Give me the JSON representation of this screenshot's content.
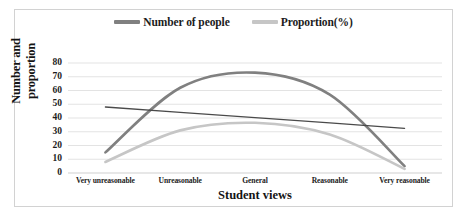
{
  "figure": {
    "border_color": "#d2d2d2",
    "background": "#ffffff"
  },
  "legend": {
    "position": "top-center",
    "entries": [
      {
        "label": "Number of people",
        "color": "#808080",
        "marker": "line-segment-icon"
      },
      {
        "label": "Proportion(%)",
        "color": "#c6c6c6",
        "marker": "line-segment-icon"
      }
    ]
  },
  "axes": {
    "ylabel": "Number and proportion",
    "xlabel": "Student views",
    "yticks": [
      "80",
      "70",
      "60",
      "50",
      "40",
      "30",
      "20",
      "10",
      "0"
    ],
    "xticks": [
      "Very unreasonable",
      "Unreasonable",
      "General",
      "Reasonable",
      "Very reasonable"
    ]
  },
  "chart_data": {
    "type": "line",
    "title": "",
    "xlabel": "Student views",
    "ylabel": "Number and proportion",
    "categories": [
      "Very unreasonable",
      "Unreasonable",
      "General",
      "Reasonable",
      "Very reasonable"
    ],
    "ylim": [
      0,
      80
    ],
    "ytick_step": 10,
    "grid": "horizontal",
    "legend_position": "top-center",
    "series": [
      {
        "name": "Number of people",
        "color": "#808080",
        "style": "smooth-curve",
        "values": [
          15,
          62,
          73,
          57,
          5
        ]
      },
      {
        "name": "Proportion(%)",
        "color": "#c6c6c6",
        "style": "smooth-curve",
        "values": [
          8,
          31,
          36.5,
          28,
          3
        ]
      },
      {
        "name": "Trend line",
        "color": "#4a4a4a",
        "style": "straight-line",
        "values": [
          48,
          44.1,
          40.2,
          36.4,
          32.5
        ]
      }
    ]
  }
}
